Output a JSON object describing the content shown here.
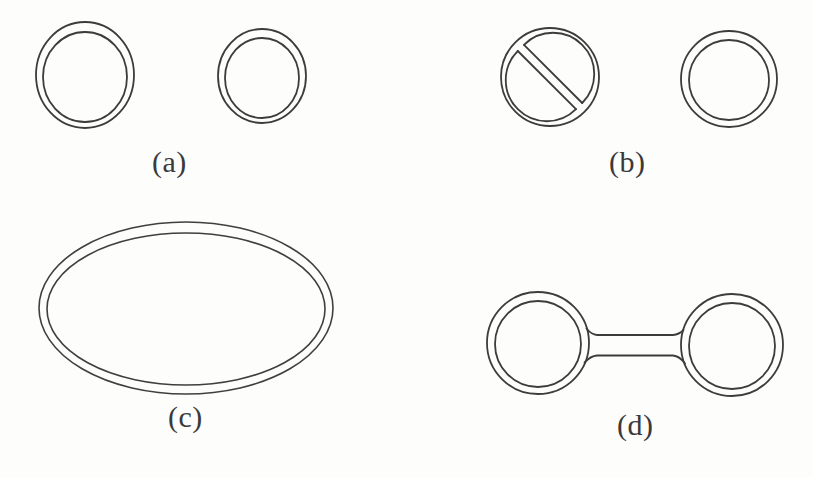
{
  "figure": {
    "background_color": "#fdfdfc",
    "stroke_color": "#3c3c3c",
    "width": 813,
    "height": 477,
    "panels": [
      {
        "id": "a",
        "label": "(a)",
        "label_x": 152,
        "label_y": 145,
        "description": "two separate circular annuli",
        "shapes": [
          {
            "kind": "annulus",
            "name": "annulus-left",
            "cx": 85,
            "cy": 75,
            "outer_rx": 49,
            "outer_ry": 53,
            "inner_rx": 42,
            "inner_ry": 45
          },
          {
            "kind": "annulus",
            "name": "annulus-right",
            "cx": 262,
            "cy": 76,
            "outer_rx": 44,
            "outer_ry": 47,
            "inner_rx": 37,
            "inner_ry": 40
          }
        ]
      },
      {
        "id": "b",
        "label": "(b)",
        "label_x": 609,
        "label_y": 145,
        "description": "circular annulus with a diagonal strip (no-entry sign) and a separate annulus",
        "shapes": [
          {
            "kind": "annulus-with-diagonal-strip",
            "name": "no-entry-annulus",
            "cx": 550,
            "cy": 77,
            "outer_rx": 49,
            "outer_ry": 49,
            "inner_rx": 41,
            "inner_ry": 41,
            "strip_angle_deg": -45,
            "strip_half_width": 6
          },
          {
            "kind": "annulus",
            "name": "annulus-right",
            "cx": 729,
            "cy": 79,
            "outer_rx": 48,
            "outer_ry": 48,
            "inner_rx": 40,
            "inner_ry": 40
          }
        ]
      },
      {
        "id": "c",
        "label": "(c)",
        "label_x": 168,
        "label_y": 400,
        "description": "one large elliptical annulus",
        "shapes": [
          {
            "kind": "annulus",
            "name": "ellipse-annulus",
            "cx": 186,
            "cy": 308,
            "outer_rx": 147,
            "outer_ry": 86,
            "inner_rx": 139,
            "inner_ry": 76
          }
        ]
      },
      {
        "id": "d",
        "label": "(d)",
        "label_x": 617,
        "label_y": 408,
        "description": "two circular annuli joined by a straight double-line bridge (dumbbell)",
        "shapes": [
          {
            "kind": "annulus",
            "name": "annulus-left",
            "cx": 538,
            "cy": 343,
            "outer_rx": 51,
            "outer_ry": 51,
            "inner_rx": 43,
            "inner_ry": 43
          },
          {
            "kind": "annulus",
            "name": "annulus-right",
            "cx": 732,
            "cy": 345,
            "outer_rx": 51,
            "outer_ry": 51,
            "inner_rx": 43,
            "inner_ry": 43
          },
          {
            "kind": "bridge",
            "name": "connecting-bridge",
            "x_start": 588,
            "x_end": 682,
            "y_top": 334,
            "y_bottom": 354,
            "flare": 7
          }
        ]
      }
    ]
  }
}
